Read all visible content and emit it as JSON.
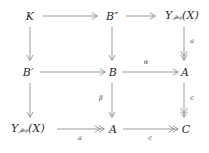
{
  "diagram": {
    "type": "commutative-diagram",
    "background": "#ffffff",
    "stroke_color": "#8a8a8a",
    "text_color": "#2b2b2b",
    "nodes": [
      {
        "id": "n00",
        "label_html": "K",
        "plain": "K",
        "row": 0,
        "col": 0
      },
      {
        "id": "n01",
        "label_html": "B″",
        "plain": "B''",
        "row": 0,
        "col": 1
      },
      {
        "id": "n02",
        "label_html": "Y_Pop(X)",
        "plain": "Y_{P^op}(X)",
        "row": 0,
        "col": 2
      },
      {
        "id": "n10",
        "label_html": "B′",
        "plain": "B'",
        "row": 1,
        "col": 0
      },
      {
        "id": "n11",
        "label_html": "B",
        "plain": "B",
        "row": 1,
        "col": 1
      },
      {
        "id": "n12",
        "label_html": "A",
        "plain": "A",
        "row": 1,
        "col": 2
      },
      {
        "id": "n20",
        "label_html": "Y_Pop(X)",
        "plain": "Y_{P^op}(X)",
        "row": 2,
        "col": 0
      },
      {
        "id": "n21",
        "label_html": "A",
        "plain": "A",
        "row": 2,
        "col": 1
      },
      {
        "id": "n22",
        "label_html": "C",
        "plain": "C",
        "row": 2,
        "col": 2
      }
    ],
    "node_text": {
      "K": "K",
      "B_double_prime_base": "B",
      "B_double_prime_mark": "″",
      "B_prime_base": "B",
      "B_prime_mark": "′",
      "B": "B",
      "A": "A",
      "C": "C",
      "Y_base": "Y",
      "Y_sub_script": "𝒫",
      "Y_sub_op": "op",
      "Y_arg": "(X)"
    },
    "arrows": [
      {
        "id": "a_K_Bpp",
        "from": "K",
        "to": "B''",
        "label": "",
        "head": "single",
        "orient": "horizontal"
      },
      {
        "id": "a_Bpp_Y",
        "from": "B''",
        "to": "Y_Pop(X)",
        "label": "",
        "head": "single",
        "orient": "horizontal"
      },
      {
        "id": "a_Bp_B",
        "from": "B'",
        "to": "B",
        "label": "",
        "head": "single",
        "orient": "horizontal"
      },
      {
        "id": "a_B_A",
        "from": "B",
        "to": "A",
        "label": "α",
        "head": "single",
        "orient": "horizontal"
      },
      {
        "id": "a_Y_A",
        "from": "Y_Pop(X)",
        "to": "A",
        "label": "a",
        "head": "double",
        "orient": "horizontal"
      },
      {
        "id": "a_A_C",
        "from": "A",
        "to": "C",
        "label": "c",
        "head": "double",
        "orient": "horizontal"
      },
      {
        "id": "v_K_Bp",
        "from": "K",
        "to": "B'",
        "label": "",
        "head": "single",
        "orient": "vertical"
      },
      {
        "id": "v_Bp_Y",
        "from": "B'",
        "to": "Y_Pop(X)",
        "label": "",
        "head": "single",
        "orient": "vertical"
      },
      {
        "id": "v_Bpp_B",
        "from": "B''",
        "to": "B",
        "label": "",
        "head": "single",
        "orient": "vertical"
      },
      {
        "id": "v_B_A",
        "from": "B",
        "to": "A",
        "label": "β",
        "head": "single",
        "orient": "vertical"
      },
      {
        "id": "v_Y_A",
        "from": "Y_Pop(X)",
        "to": "A",
        "label": "a",
        "head": "double",
        "orient": "vertical"
      },
      {
        "id": "v_A_C",
        "from": "A",
        "to": "C",
        "label": "c",
        "head": "double",
        "orient": "vertical"
      }
    ],
    "labels": {
      "alpha": "α",
      "beta": "β",
      "a": "a",
      "c": "c"
    }
  }
}
